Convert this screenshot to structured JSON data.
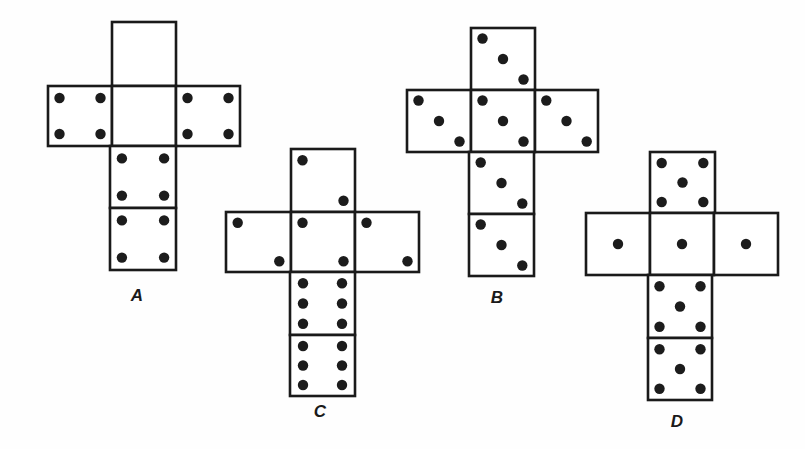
{
  "figure": {
    "nets": [
      {
        "label": "A",
        "label_pos": [
          137,
          286
        ],
        "faces": [
          {
            "position": "top",
            "x": 112,
            "y": 22,
            "w": 64,
            "h": 64,
            "pips": 0,
            "pattern": "blank"
          },
          {
            "position": "middle-left",
            "x": 48,
            "y": 86,
            "w": 64,
            "h": 60,
            "pips": 4,
            "pattern": "four"
          },
          {
            "position": "middle-center",
            "x": 112,
            "y": 86,
            "w": 64,
            "h": 60,
            "pips": 0,
            "pattern": "blank"
          },
          {
            "position": "middle-right",
            "x": 176,
            "y": 86,
            "w": 64,
            "h": 60,
            "pips": 4,
            "pattern": "four"
          },
          {
            "position": "lower-1",
            "x": 110,
            "y": 146,
            "w": 66,
            "h": 62,
            "pips": 4,
            "pattern": "four"
          },
          {
            "position": "lower-2",
            "x": 110,
            "y": 208,
            "w": 66,
            "h": 62,
            "pips": 4,
            "pattern": "four"
          }
        ]
      },
      {
        "label": "C",
        "label_pos": [
          320,
          402
        ],
        "faces": [
          {
            "position": "top",
            "x": 291,
            "y": 149,
            "w": 64,
            "h": 63,
            "pips": 2,
            "pattern": "two-diag"
          },
          {
            "position": "middle-left",
            "x": 226,
            "y": 212,
            "w": 65,
            "h": 60,
            "pips": 2,
            "pattern": "two-diag"
          },
          {
            "position": "middle-center",
            "x": 291,
            "y": 212,
            "w": 64,
            "h": 60,
            "pips": 2,
            "pattern": "two-diag"
          },
          {
            "position": "middle-right",
            "x": 355,
            "y": 212,
            "w": 64,
            "h": 60,
            "pips": 2,
            "pattern": "two-diag"
          },
          {
            "position": "lower-1",
            "x": 290,
            "y": 272,
            "w": 65,
            "h": 63,
            "pips": 6,
            "pattern": "six"
          },
          {
            "position": "lower-2",
            "x": 290,
            "y": 335,
            "w": 65,
            "h": 61,
            "pips": 6,
            "pattern": "six"
          }
        ]
      },
      {
        "label": "B",
        "label_pos": [
          497,
          288
        ],
        "faces": [
          {
            "position": "top",
            "x": 471,
            "y": 28,
            "w": 64,
            "h": 62,
            "pips": 3,
            "pattern": "three-diag"
          },
          {
            "position": "middle-left",
            "x": 407,
            "y": 90,
            "w": 64,
            "h": 62,
            "pips": 3,
            "pattern": "three-diag"
          },
          {
            "position": "middle-center",
            "x": 471,
            "y": 90,
            "w": 64,
            "h": 62,
            "pips": 3,
            "pattern": "three-diag"
          },
          {
            "position": "middle-right",
            "x": 535,
            "y": 90,
            "w": 63,
            "h": 62,
            "pips": 3,
            "pattern": "three-diag"
          },
          {
            "position": "lower-1",
            "x": 469,
            "y": 152,
            "w": 65,
            "h": 62,
            "pips": 3,
            "pattern": "three-diag"
          },
          {
            "position": "lower-2",
            "x": 469,
            "y": 214,
            "w": 65,
            "h": 62,
            "pips": 3,
            "pattern": "three-diag"
          }
        ]
      },
      {
        "label": "D",
        "label_pos": [
          677,
          412
        ],
        "faces": [
          {
            "position": "top",
            "x": 650,
            "y": 152,
            "w": 65,
            "h": 61,
            "pips": 5,
            "pattern": "five"
          },
          {
            "position": "middle-left",
            "x": 586,
            "y": 213,
            "w": 64,
            "h": 62,
            "pips": 1,
            "pattern": "one"
          },
          {
            "position": "middle-center",
            "x": 650,
            "y": 213,
            "w": 64,
            "h": 62,
            "pips": 1,
            "pattern": "one"
          },
          {
            "position": "middle-right",
            "x": 714,
            "y": 213,
            "w": 64,
            "h": 62,
            "pips": 1,
            "pattern": "one"
          },
          {
            "position": "lower-1",
            "x": 648,
            "y": 275,
            "w": 64,
            "h": 63,
            "pips": 5,
            "pattern": "five"
          },
          {
            "position": "lower-2",
            "x": 648,
            "y": 338,
            "w": 64,
            "h": 62,
            "pips": 5,
            "pattern": "five"
          }
        ]
      }
    ]
  },
  "colors": {
    "background": "#ffffff",
    "line": "#1a1a1a",
    "pip": "#1c1c1c"
  }
}
